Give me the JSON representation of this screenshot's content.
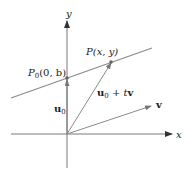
{
  "diagram": {
    "axes": {
      "x_label": "x",
      "y_label": "y"
    },
    "points": {
      "p0": {
        "name": "P",
        "sub": "0",
        "coords": "(0, b)"
      },
      "p": {
        "name": "P",
        "coords": "(x, y)"
      }
    },
    "vectors": {
      "u0": {
        "name": "u",
        "sub": "0"
      },
      "u0_plus_tv": {
        "name": "u",
        "sub": "0",
        "rest_op": " + ",
        "rest_t": "t",
        "rest_v": "v"
      },
      "v": {
        "name": "v"
      }
    },
    "colors": {
      "line": "#8a8a8a",
      "axes": "#7a7a7a",
      "arrowhead": "#333333",
      "text": "#222222"
    }
  }
}
